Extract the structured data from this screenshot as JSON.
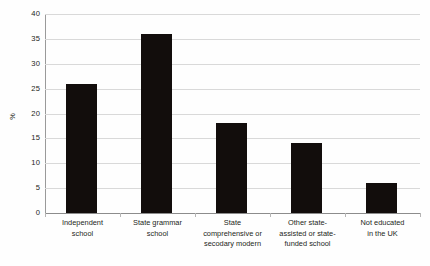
{
  "chart_data": {
    "type": "bar",
    "title": "",
    "subtitle": "",
    "xlabel": "",
    "ylabel": "%",
    "ylim": [
      0,
      40
    ],
    "ytick_step": 5,
    "yticks": [
      0,
      5,
      10,
      15,
      20,
      25,
      30,
      35,
      40
    ],
    "ytick_labels": [
      "0",
      "5",
      "10",
      "15",
      "20",
      "25",
      "30",
      "35",
      "40"
    ],
    "grid": true,
    "legend": false,
    "legend_position": "none",
    "bar_color": "#120d0c",
    "gridline_color": "#d9d9d9",
    "axis_color": "#8c8c8c",
    "background_color": "#fefefe",
    "categories": [
      "Independent school",
      "State grammar school",
      "State comprehensive or secodary modern",
      "Other state-assisted or state-funded school",
      "Not educated in the UK"
    ],
    "category_label_lines": [
      [
        "Independent",
        "school"
      ],
      [
        "State grammar",
        "school"
      ],
      [
        "State",
        "comprehensive or",
        "secodary modern"
      ],
      [
        "Other state-",
        "assisted or state-",
        "funded school"
      ],
      [
        "Not educated",
        "in the UK"
      ]
    ],
    "values": [
      26,
      36,
      18,
      14,
      6
    ],
    "series": [
      {
        "name": "Percentage",
        "values": [
          26,
          36,
          18,
          14,
          6
        ]
      }
    ]
  }
}
